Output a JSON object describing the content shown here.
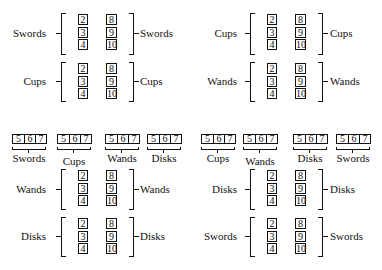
{
  "diagram": {
    "column_values": {
      "low": [
        "2",
        "3",
        "4"
      ],
      "high": [
        "8",
        "9",
        "10"
      ]
    },
    "row_values": [
      "5",
      "6",
      "7"
    ],
    "blocks": [
      {
        "id": "tl1",
        "left_label": "Swords",
        "right_label": "Swords"
      },
      {
        "id": "tl2",
        "left_label": "Cups",
        "right_label": "Cups"
      },
      {
        "id": "tr1",
        "left_label": "Cups",
        "right_label": "Cups"
      },
      {
        "id": "tr2",
        "left_label": "Wands",
        "right_label": "Wands"
      },
      {
        "id": "bl1",
        "left_label": "Wands",
        "right_label": "Wands"
      },
      {
        "id": "bl2",
        "left_label": "Disks",
        "right_label": "Disks"
      },
      {
        "id": "br1",
        "left_label": "Disks",
        "right_label": "Disks"
      },
      {
        "id": "br2",
        "left_label": "Swords",
        "right_label": "Swords"
      }
    ],
    "row_groups_left": [
      "Swords",
      "Cups",
      "Wands",
      "Disks"
    ],
    "row_groups_right": [
      "Cups",
      "Wands",
      "Disks",
      "Swords"
    ]
  }
}
